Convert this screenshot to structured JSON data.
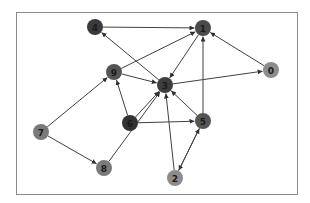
{
  "diagram": {
    "type": "directed-graph",
    "frame": {
      "x": 16,
      "y": 12,
      "width": 281,
      "height": 182,
      "stroke": "#8a8a8a"
    },
    "edge_color": "#404040",
    "node_radius": 8,
    "nodes": [
      {
        "id": "0",
        "label": "0",
        "x": 271,
        "y": 70,
        "fill": "#8c8c8c"
      },
      {
        "id": "1",
        "label": "1",
        "x": 203,
        "y": 28,
        "fill": "#4a4a4a"
      },
      {
        "id": "2",
        "label": "2",
        "x": 175,
        "y": 178,
        "fill": "#8c8c8c"
      },
      {
        "id": "3",
        "label": "3",
        "x": 165,
        "y": 85,
        "fill": "#3e3e3e"
      },
      {
        "id": "4",
        "label": "4",
        "x": 95,
        "y": 27,
        "fill": "#3a3a3a"
      },
      {
        "id": "5",
        "label": "5",
        "x": 203,
        "y": 121,
        "fill": "#555555"
      },
      {
        "id": "6",
        "label": "6",
        "x": 130,
        "y": 123,
        "fill": "#333333"
      },
      {
        "id": "7",
        "label": "7",
        "x": 41,
        "y": 132,
        "fill": "#7a7a7a"
      },
      {
        "id": "8",
        "label": "8",
        "x": 104,
        "y": 168,
        "fill": "#7a7a7a"
      },
      {
        "id": "9",
        "label": "9",
        "x": 114,
        "y": 72,
        "fill": "#555555"
      }
    ],
    "edges": [
      {
        "from": "4",
        "to": "1"
      },
      {
        "from": "9",
        "to": "1"
      },
      {
        "from": "1",
        "to": "3"
      },
      {
        "from": "5",
        "to": "1"
      },
      {
        "from": "0",
        "to": "1"
      },
      {
        "from": "3",
        "to": "0"
      },
      {
        "from": "3",
        "to": "4"
      },
      {
        "from": "9",
        "to": "3"
      },
      {
        "from": "7",
        "to": "9"
      },
      {
        "from": "6",
        "to": "9"
      },
      {
        "from": "6",
        "to": "3"
      },
      {
        "from": "5",
        "to": "3"
      },
      {
        "from": "2",
        "to": "3"
      },
      {
        "from": "6",
        "to": "5"
      },
      {
        "from": "8",
        "to": "3"
      },
      {
        "from": "7",
        "to": "8"
      },
      {
        "from": "5",
        "to": "2"
      },
      {
        "from": "2",
        "to": "5"
      }
    ]
  }
}
